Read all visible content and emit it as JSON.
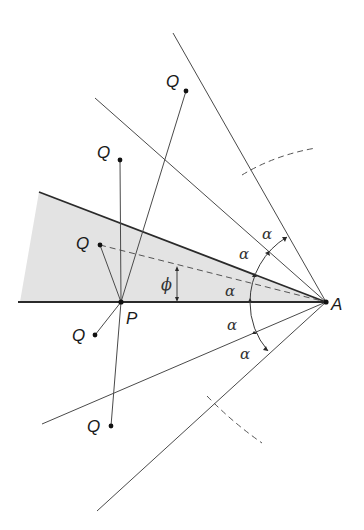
{
  "diagram": {
    "type": "geometric construction",
    "colors": {
      "line": "#3a3a3a",
      "shade": "#e3e3e3",
      "text": "#1a1a1a",
      "background": "#ffffff"
    },
    "points": {
      "A": {
        "label": "A",
        "x": 326,
        "y": 302
      },
      "P": {
        "label": "P",
        "x": 121,
        "y": 302
      }
    },
    "q_points": [
      {
        "label": "Q",
        "x": 186,
        "y": 91
      },
      {
        "label": "Q",
        "x": 120,
        "y": 160
      },
      {
        "label": "Q",
        "x": 100,
        "y": 245
      },
      {
        "label": "Q",
        "x": 95,
        "y": 335
      },
      {
        "label": "Q",
        "x": 111,
        "y": 426
      }
    ],
    "angle_labels": {
      "alpha": "α",
      "phi": "ϕ"
    },
    "angles": [
      {
        "label": "α",
        "x": 262,
        "y": 234
      },
      {
        "label": "α",
        "x": 239,
        "y": 255
      },
      {
        "label": "α",
        "x": 231,
        "y": 293
      },
      {
        "label": "α",
        "x": 233,
        "y": 329
      },
      {
        "label": "α",
        "x": 246,
        "y": 359
      }
    ],
    "phi": {
      "label": "ϕ",
      "x": 167,
      "y": 287
    }
  }
}
